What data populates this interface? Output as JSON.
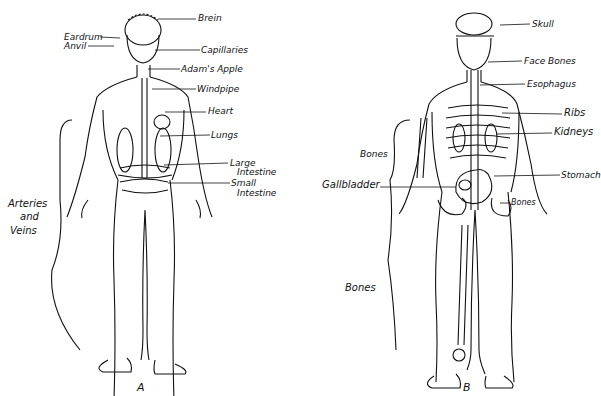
{
  "figure_a": {
    "caption": "A",
    "labels": {
      "brain": "Brein",
      "eardrum": "Eardrum",
      "anvil": "Anvil",
      "capillaries": "Capillaries",
      "adams_apple": "Adam's Apple",
      "windpipe": "Windpipe",
      "heart": "Heart",
      "lungs": "Lungs",
      "large_intestine_1": "Large",
      "large_intestine_2": "Intestine",
      "small_intestine_1": "Small",
      "small_intestine_2": "Intestine",
      "arteries_1": "Arteries",
      "arteries_2": "and",
      "arteries_3": "Veins"
    }
  },
  "figure_b": {
    "caption": "B",
    "labels": {
      "skull": "Skull",
      "face_bones": "Face Bones",
      "esophagus": "Esophagus",
      "ribs": "Ribs",
      "kidneys": "Kidneys",
      "bones_arm": "Bones",
      "gallbladder": "Gallbladder",
      "stomach": "Stomach",
      "bones_hip": "Bones",
      "bones_leg": "Bones"
    }
  }
}
